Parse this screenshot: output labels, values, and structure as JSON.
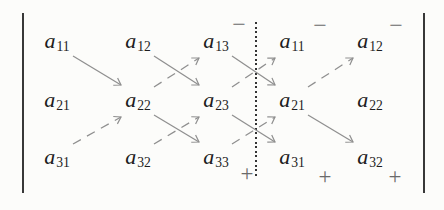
{
  "figure": {
    "kind": "rule-of-sarrus-determinant-diagram",
    "colors": {
      "background": "#fcfcfa",
      "ink": "#1d1d1d",
      "arrow": "#8f8f8f",
      "sign": "#6a6a6a",
      "bar": "#383838",
      "dot": "#333333"
    },
    "matrix": {
      "row_y": [
        42,
        101,
        158
      ],
      "col_x": [
        57,
        138,
        216,
        292,
        370
      ],
      "cells": [
        [
          {
            "base": "a",
            "sub": "11"
          },
          {
            "base": "a",
            "sub": "12"
          },
          {
            "base": "a",
            "sub": "13"
          },
          {
            "base": "a",
            "sub": "11"
          },
          {
            "base": "a",
            "sub": "12"
          }
        ],
        [
          {
            "base": "a",
            "sub": "21"
          },
          {
            "base": "a",
            "sub": "22"
          },
          {
            "base": "a",
            "sub": "23"
          },
          {
            "base": "a",
            "sub": "21"
          },
          {
            "base": "a",
            "sub": "22"
          }
        ],
        [
          {
            "base": "a",
            "sub": "31"
          },
          {
            "base": "a",
            "sub": "32"
          },
          {
            "base": "a",
            "sub": "33"
          },
          {
            "base": "a",
            "sub": "31"
          },
          {
            "base": "a",
            "sub": "32"
          }
        ]
      ]
    },
    "notation": {
      "left_bar": {
        "x": 23,
        "top": 13,
        "bottom": 193
      },
      "right_bar": {
        "x": 424,
        "top": 13,
        "bottom": 193
      },
      "dotted_separator": {
        "x": 256,
        "top": 22,
        "bottom": 177
      }
    },
    "signs": {
      "minus": {
        "label": "−",
        "positions": [
          {
            "x": 239,
            "y": 24
          },
          {
            "x": 320,
            "y": 25
          },
          {
            "x": 396,
            "y": 25
          }
        ]
      },
      "plus": {
        "label": "+",
        "positions": [
          {
            "x": 247,
            "y": 173
          },
          {
            "x": 325,
            "y": 176
          },
          {
            "x": 395,
            "y": 176
          }
        ]
      }
    },
    "arrows": {
      "solid": [
        {
          "from": [
            0,
            0
          ],
          "to": [
            1,
            1
          ]
        },
        {
          "from": [
            0,
            1
          ],
          "to": [
            1,
            2
          ]
        },
        {
          "from": [
            0,
            2
          ],
          "to": [
            1,
            3
          ]
        },
        {
          "from": [
            1,
            1
          ],
          "to": [
            2,
            2
          ]
        },
        {
          "from": [
            1,
            2
          ],
          "to": [
            2,
            3
          ]
        },
        {
          "from": [
            1,
            3
          ],
          "to": [
            2,
            4
          ]
        }
      ],
      "dashed": [
        {
          "from": [
            2,
            0
          ],
          "to": [
            1,
            1
          ]
        },
        {
          "from": [
            2,
            1
          ],
          "to": [
            1,
            2
          ]
        },
        {
          "from": [
            2,
            2
          ],
          "to": [
            1,
            3
          ]
        },
        {
          "from": [
            1,
            1
          ],
          "to": [
            0,
            2
          ]
        },
        {
          "from": [
            1,
            2
          ],
          "to": [
            0,
            3
          ]
        },
        {
          "from": [
            1,
            3
          ],
          "to": [
            0,
            4
          ]
        }
      ]
    }
  }
}
